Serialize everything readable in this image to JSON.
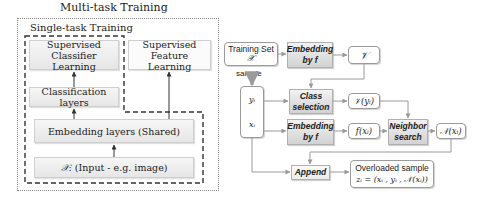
{
  "left_panel": {
    "outer_title": "Multi-task Training",
    "inner_title": "Single-task Training",
    "boxes": {
      "supervised_classifier": [
        "Supervised",
        "Classifier Learning"
      ],
      "supervised_feature": [
        "Supervised",
        "Feature Learning"
      ],
      "classification_layers": "Classification layers",
      "embedding_layers": "Embedding layers (Shared)",
      "input_symbol": "𝒳",
      "input_label": ": (Input - e.g. image)"
    }
  },
  "right_panel": {
    "training_set": {
      "label": "Training Set",
      "symbol": "𝒳"
    },
    "sample_label": "sample",
    "embedding_top": [
      "Embedding",
      "by f"
    ],
    "v_set": "𝒱",
    "sample_box": {
      "y": "yᵢ",
      "x": "xᵢ"
    },
    "class_selection": [
      "Class",
      "selection"
    ],
    "v_of_y": "𝒱(yᵢ)",
    "embedding_bottom": [
      "Embedding",
      "by f"
    ],
    "f_of_x": "f(xᵢ)",
    "neighbor_search": [
      "Neighbor",
      "search"
    ],
    "n_of_x": "𝒩(xᵢ)",
    "append": "Append",
    "overloaded": {
      "title": "Overloaded sample",
      "formula": "zᵢ = (xᵢ , yᵢ , 𝒩(xᵢ))"
    }
  },
  "colors": {
    "line": "#555555",
    "arrow": "#333333",
    "box_border": "#9a9a9a",
    "gradient_box_dark": "#d2d2d2"
  }
}
